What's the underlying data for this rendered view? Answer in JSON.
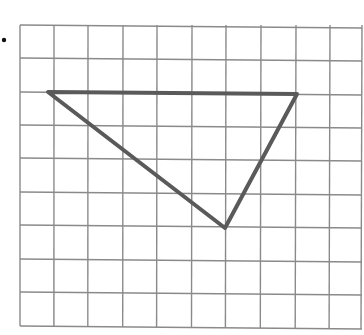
{
  "diagram": {
    "type": "grid-with-triangle",
    "bullet": {
      "x": 4,
      "y": 40,
      "r": 2.2,
      "color": "#111111"
    },
    "grid": {
      "columns": 10,
      "rows": 9,
      "x_lines": [
        20,
        54,
        88,
        123,
        157,
        192,
        226,
        261,
        296,
        330,
        362
      ],
      "y_lines": [
        25,
        58,
        92,
        125,
        158,
        192,
        225,
        259,
        292,
        326
      ],
      "line_color": "#8a8a8a",
      "line_width": 1.4
    },
    "triangle": {
      "vertices": [
        {
          "label": "top-left",
          "x": 48,
          "y": 92
        },
        {
          "label": "top-right",
          "x": 297,
          "y": 94
        },
        {
          "label": "bottom",
          "x": 225,
          "y": 228
        }
      ],
      "grid_vertices": [
        {
          "col": 0.8,
          "row": 2
        },
        {
          "col": 8,
          "row": 2
        },
        {
          "col": 6,
          "row": 6
        }
      ],
      "stroke_color": "#5a5a5a",
      "stroke_width": 4
    }
  }
}
